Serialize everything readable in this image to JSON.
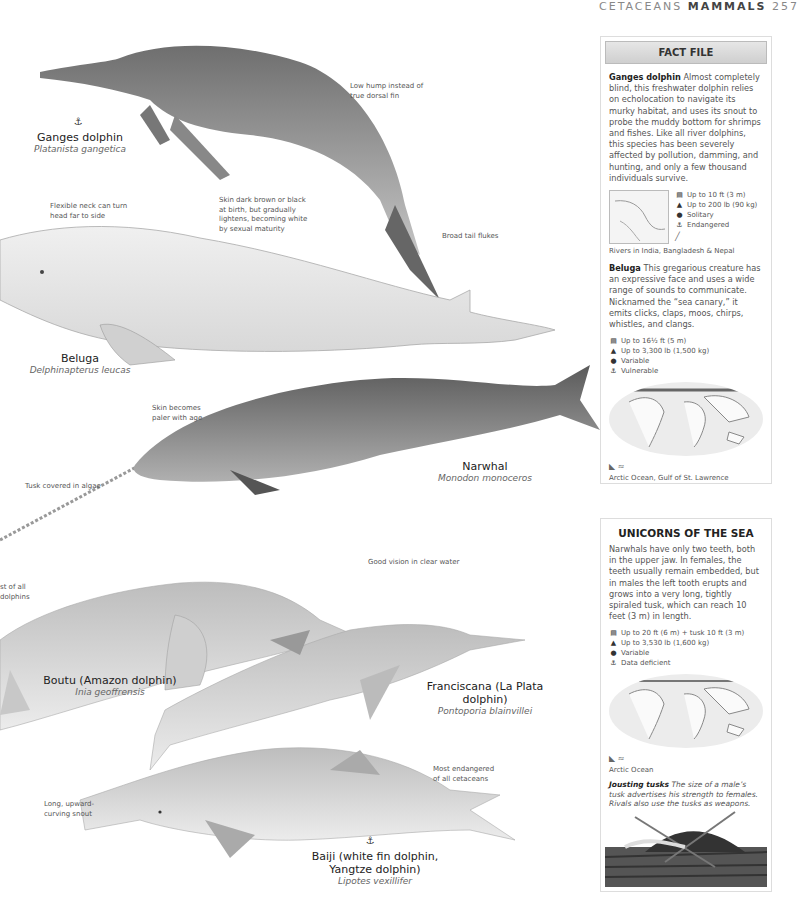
{
  "header": {
    "section": "CETACEANS",
    "subsection": "MAMMALS",
    "page_number": "257"
  },
  "species": [
    {
      "name": "Ganges dolphin",
      "scientific": "Platanista gangetica",
      "status_icon": "endangered-icon",
      "annotations": [
        "Low hump instead of true dorsal fin",
        "Broad tail flukes"
      ]
    },
    {
      "name": "Beluga",
      "scientific": "Delphinapterus leucas",
      "annotations": [
        "Flexible neck can turn head far to side",
        "Skin dark brown or black at birth, but gradually lightens, becoming white by sexual maturity"
      ]
    },
    {
      "name": "Narwhal",
      "scientific": "Monodon monoceros",
      "annotations": [
        "Skin becomes paler with age",
        "Tusk covered in algae"
      ]
    },
    {
      "name": "Boutu (Amazon dolphin)",
      "scientific": "Inia geoffrensis",
      "annotations": [
        "Good vision in clear water",
        "st of all dolphins"
      ]
    },
    {
      "name": "Franciscana (La Plata dolphin)",
      "scientific": "Pontoporia blainvillei",
      "annotations": []
    },
    {
      "name": "Baiji (white fin dolphin, Yangtze dolphin)",
      "scientific": "Lipotes vexillifer",
      "status_icon": "endangered-icon",
      "annotations": [
        "Long, upward-curving snout",
        "Most endangered of all cetaceans"
      ]
    }
  ],
  "fact_file": {
    "title": "FACT FILE",
    "ganges": {
      "name": "Ganges dolphin",
      "text": "Almost completely blind, this freshwater dolphin relies on echolocation to navigate its murky habitat, and uses its snout to probe the muddy bottom for shrimps and fishes. Like all river dolphins, this species has been severely affected by pollution, damming, and hunting, and only a few thousand individuals survive.",
      "stats": [
        "Up to 10 ft (3 m)",
        "Up to 200 lb (90 kg)",
        "Solitary",
        "Endangered"
      ],
      "habitat": "Rivers in India, Bangladesh & Nepal"
    },
    "beluga": {
      "name": "Beluga",
      "text": "This gregarious creature has an expressive face and uses a wide range of sounds to communicate. Nicknamed the “sea canary,” it emits clicks, claps, moos, chirps, whistles, and clangs.",
      "stats": [
        "Up to 16½ ft (5 m)",
        "Up to 3,300 lb (1,500 kg)",
        "Variable",
        "Vulnerable"
      ],
      "habitat": "Arctic Ocean, Gulf of St. Lawrence"
    }
  },
  "unicorns": {
    "title": "UNICORNS OF THE SEA",
    "text": "Narwhals have only two teeth, both in the upper jaw. In females, the teeth usually remain embedded, but in males the left tooth erupts and grows into a very long, tightly spiraled tusk, which can reach 10 feet (3 m) in length.",
    "stats": [
      "Up to 20 ft (6 m) + tusk 10 ft (3 m)",
      "Up to 3,530 lb (1,600 kg)",
      "Variable",
      "Data deficient"
    ],
    "habitat": "Arctic Ocean",
    "jousting_title": "Jousting tusks",
    "jousting_text": "The size of a male’s tusk advertises his strength to females. Rivals also use the tusks as weapons."
  },
  "stat_icons": [
    "length-icon",
    "weight-icon",
    "social-icon",
    "status-icon"
  ]
}
